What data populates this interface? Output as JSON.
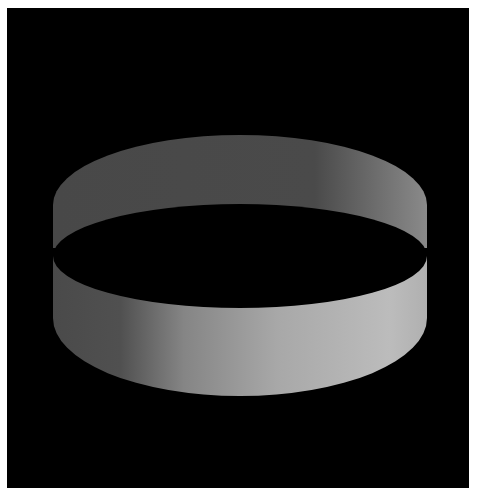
{
  "scene": {
    "description": "Rendered 3D gray cylindrical band (open cylinder/ring) on black background",
    "background": "#000000",
    "frame_background": "#ffffff",
    "band": {
      "back_inner_color": "#474747",
      "front_dark_color": "#4a4a4a",
      "front_light_color": "#b8b8b8",
      "top_color": "#505050"
    }
  }
}
